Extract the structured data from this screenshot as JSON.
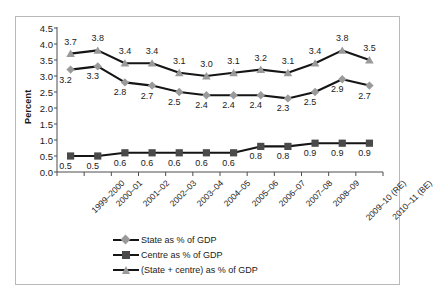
{
  "chart_data": {
    "type": "line",
    "title": "",
    "xlabel": "",
    "ylabel": "Percent",
    "ylim": [
      0.0,
      4.5
    ],
    "ytick_step": 0.5,
    "yticks": [
      "4.5",
      "4.0",
      "3.5",
      "3.0",
      "2.5",
      "2.0",
      "1.5",
      "1.0",
      "0.5",
      "0.0"
    ],
    "grid": false,
    "legend_position": "bottom-center",
    "categories": [
      "1999–2000",
      "2000–01",
      "2001–02",
      "2002–03",
      "2003–04",
      "2004–05",
      "2005–06",
      "2006–07",
      "2007–08",
      "2008–09",
      "2009–10 (RE)",
      "2010–11 (BE)"
    ],
    "series": [
      {
        "name": "State as % of GDP",
        "marker": "diamond",
        "marker_color": "#9a9a9a",
        "line_color": "#151515",
        "label_position": "below",
        "values": [
          3.2,
          3.3,
          2.8,
          2.7,
          2.5,
          2.4,
          2.4,
          2.4,
          2.3,
          2.5,
          2.9,
          2.7
        ],
        "labels": [
          "3.2",
          "3.3",
          "2.8",
          "2.7",
          "2.5",
          "2.4",
          "2.4",
          "2.4",
          "2.3",
          "2.5",
          "2.9",
          "2.7"
        ]
      },
      {
        "name": "Centre as % of GDP",
        "marker": "square",
        "marker_color": "#4a4a4a",
        "line_color": "#151515",
        "label_position": "below",
        "values": [
          0.5,
          0.5,
          0.6,
          0.6,
          0.6,
          0.6,
          0.6,
          0.8,
          0.8,
          0.9,
          0.9,
          0.9
        ],
        "labels": [
          "0.5",
          "0.5",
          "0.6",
          "0.6",
          "0.6",
          "0.6",
          "0.6",
          "0.8",
          "0.8",
          "0.9",
          "0.9",
          "0.9"
        ]
      },
      {
        "name": "(State + centre) as % of GDP",
        "marker": "triangle",
        "marker_color": "#9a9a9a",
        "line_color": "#151515",
        "label_position": "above",
        "values": [
          3.7,
          3.8,
          3.4,
          3.4,
          3.1,
          3.0,
          3.1,
          3.2,
          3.1,
          3.4,
          3.8,
          3.5
        ],
        "labels": [
          "3.7",
          "3.8",
          "3.4",
          "3.4",
          "3.1",
          "3.0",
          "3.1",
          "3.2",
          "3.1",
          "3.4",
          "3.8",
          "3.5"
        ]
      }
    ]
  },
  "legend": {
    "items": [
      {
        "label": "State as % of GDP",
        "marker": "diamond"
      },
      {
        "label": "Centre as % of GDP",
        "marker": "square"
      },
      {
        "label": "(State + centre) as % of GDP",
        "marker": "triangle"
      }
    ]
  },
  "geometry": {
    "plot_left": 57,
    "plot_right": 383,
    "plot_top": 28,
    "plot_bottom": 172
  }
}
